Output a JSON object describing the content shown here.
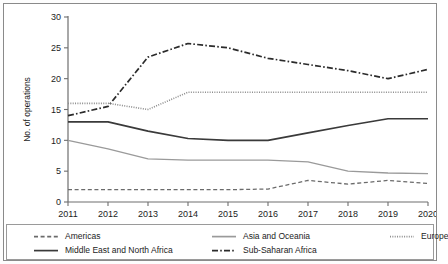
{
  "chart_data": {
    "type": "line",
    "title": "",
    "xlabel": "",
    "ylabel": "No. of operations",
    "categories": [
      "2011",
      "2012",
      "2013",
      "2014",
      "2015",
      "2016",
      "2017",
      "2018",
      "2019",
      "2020"
    ],
    "x": [
      2011,
      2012,
      2013,
      2014,
      2015,
      2016,
      2017,
      2018,
      2019,
      2020
    ],
    "ylim": [
      0,
      30
    ],
    "yticks": [
      0,
      5,
      10,
      15,
      20,
      25,
      30
    ],
    "ytick_labels": [
      "0",
      "5",
      "10",
      "15",
      "20",
      "25",
      "30"
    ],
    "grid": false,
    "legend_position": "bottom",
    "series": [
      {
        "name": "Americas",
        "style": "dashed",
        "color": "#6b6b6b",
        "width": 1.3,
        "values": [
          2.0,
          2.0,
          2.0,
          2.0,
          2.0,
          2.1,
          3.5,
          2.9,
          3.5,
          3.0
        ]
      },
      {
        "name": "Middle East and North Africa",
        "style": "solid",
        "color": "#3a3a3a",
        "width": 1.7,
        "values": [
          13.0,
          13.0,
          11.5,
          10.3,
          10.0,
          10.0,
          11.2,
          12.4,
          13.5,
          13.5
        ]
      },
      {
        "name": "Asia and Oceania",
        "style": "solid",
        "color": "#9a9a9a",
        "width": 1.3,
        "values": [
          10.0,
          8.6,
          7.0,
          6.8,
          6.8,
          6.8,
          6.5,
          5.0,
          4.7,
          4.6
        ]
      },
      {
        "name": "Sub-Saharan Africa",
        "style": "dashdot",
        "color": "#2b2b2b",
        "width": 1.7,
        "values": [
          14.0,
          15.5,
          23.5,
          25.7,
          25.0,
          23.3,
          22.3,
          21.3,
          20.0,
          21.5
        ]
      },
      {
        "name": "Europe",
        "style": "dotted",
        "color": "#8d8d8d",
        "width": 1.6,
        "values": [
          16.0,
          16.0,
          15.0,
          17.8,
          17.8,
          17.8,
          17.8,
          17.8,
          17.8,
          17.8
        ]
      }
    ]
  },
  "legend": {
    "entries": [
      {
        "label": "Americas",
        "style": "dashed",
        "color": "#6b6b6b"
      },
      {
        "label": "Asia and Oceania",
        "style": "solid",
        "color": "#9a9a9a"
      },
      {
        "label": "Europe",
        "style": "dotted",
        "color": "#8d8d8d"
      },
      {
        "label": "Middle East and North Africa",
        "style": "solid",
        "color": "#3a3a3a"
      },
      {
        "label": "Sub-Saharan Africa",
        "style": "dashdot",
        "color": "#2b2b2b"
      }
    ]
  },
  "axis": {
    "y_title": "No. of operations",
    "axis_color": "#6e6e6e"
  }
}
